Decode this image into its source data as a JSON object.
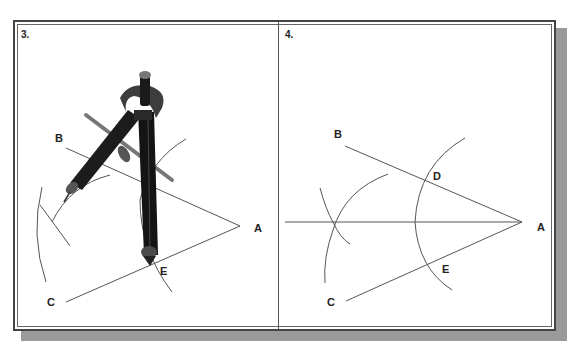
{
  "figure": {
    "panels": [
      {
        "number": "3.",
        "description": "Compass drawing arc from point E while bisecting angle BAC",
        "points": {
          "A": "A",
          "B": "B",
          "C": "C",
          "E": "E"
        }
      },
      {
        "number": "4.",
        "description": "Completed angle bisector construction",
        "points": {
          "A": "A",
          "B": "B",
          "C": "C",
          "D": "D",
          "E": "E"
        }
      }
    ]
  },
  "colors": {
    "line": "#555555",
    "frame": "#444444",
    "shadow": "#9a9a9a",
    "compass": "#1a1a1a"
  }
}
